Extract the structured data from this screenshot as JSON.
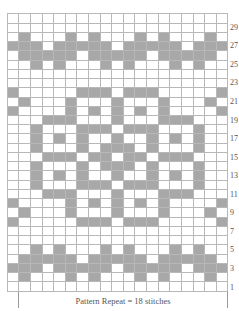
{
  "chart": {
    "columns": 19,
    "rows": 30,
    "colors": {
      "shaded": "#a8a8a8",
      "empty": "#ffffff",
      "gridline": "#b8b8b8"
    },
    "row_labels": [
      "29",
      "27",
      "25",
      "23",
      "21",
      "19",
      "17",
      "15",
      "13",
      "11",
      "9",
      "7",
      "5",
      "3",
      "1"
    ],
    "row_label_numbers": [
      29,
      27,
      25,
      23,
      21,
      19,
      17,
      15,
      13,
      11,
      9,
      7,
      5,
      3,
      1
    ],
    "shaded_cells_by_row": {
      "30": [],
      "29": [],
      "28": [
        1,
        5,
        7,
        11,
        13,
        17
      ],
      "27": [
        0,
        1,
        2,
        4,
        5,
        6,
        7,
        8,
        10,
        11,
        12,
        13,
        14,
        16,
        17,
        18
      ],
      "26": [
        1,
        2,
        3,
        4,
        5,
        7,
        8,
        9,
        10,
        11,
        13,
        14,
        15,
        16,
        17
      ],
      "25": [
        2,
        4,
        8,
        10,
        14,
        16
      ],
      "24": [],
      "23": [],
      "22": [
        0,
        6,
        7,
        8,
        10,
        11,
        12,
        18
      ],
      "21": [
        1,
        5,
        9,
        13,
        17
      ],
      "20": [
        0,
        5,
        7,
        9,
        11,
        13,
        18
      ],
      "19": [
        3,
        4,
        5,
        9,
        13,
        14,
        15
      ],
      "18": [
        2,
        6,
        7,
        8,
        10,
        11,
        12,
        16
      ],
      "17": [
        2,
        4,
        6,
        9,
        12,
        14,
        16
      ],
      "16": [
        2,
        6,
        8,
        9,
        10,
        12,
        16
      ],
      "15": [
        3,
        4,
        5,
        7,
        8,
        10,
        11,
        13,
        14,
        15
      ],
      "14": [
        2,
        6,
        8,
        9,
        10,
        12,
        16
      ],
      "13": [
        2,
        4,
        6,
        9,
        12,
        14,
        16
      ],
      "12": [
        2,
        6,
        7,
        8,
        10,
        11,
        12,
        16
      ],
      "11": [
        3,
        4,
        5,
        9,
        13,
        14,
        15
      ],
      "10": [
        0,
        5,
        7,
        9,
        11,
        13,
        18
      ],
      "9": [
        1,
        5,
        9,
        13,
        17
      ],
      "8": [
        0,
        6,
        7,
        8,
        10,
        11,
        12,
        18
      ],
      "7": [],
      "6": [],
      "5": [
        2,
        4,
        8,
        10,
        14,
        16
      ],
      "4": [
        1,
        2,
        3,
        4,
        5,
        7,
        8,
        9,
        10,
        11,
        13,
        14,
        15,
        16,
        17
      ],
      "3": [
        0,
        1,
        2,
        4,
        5,
        6,
        7,
        8,
        10,
        11,
        12,
        13,
        14,
        16,
        17,
        18
      ],
      "2": [
        1,
        5,
        7,
        11,
        13,
        17
      ],
      "1": []
    },
    "repeat_label": "Pattern Repeat = 18 stitches",
    "repeat_start_col": 1,
    "repeat_end_col": 18
  }
}
